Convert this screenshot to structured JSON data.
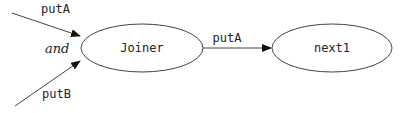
{
  "diagram": {
    "nodes": [
      {
        "id": "joiner",
        "label": "Joiner",
        "cx": 142,
        "cy": 48,
        "rx": 61,
        "ry": 24
      },
      {
        "id": "next1",
        "label": "next1",
        "cx": 332,
        "cy": 48,
        "rx": 60,
        "ry": 24
      }
    ],
    "edges": [
      {
        "from": "external",
        "to": "joiner",
        "label": "putA"
      },
      {
        "from": "external",
        "to": "joiner",
        "label": "putB"
      },
      {
        "from": "joiner",
        "to": "next1",
        "label": "putA"
      }
    ],
    "join_label": "and",
    "colors": {
      "stroke": "#444444",
      "text": "#222222",
      "background": "#ffffff"
    }
  }
}
